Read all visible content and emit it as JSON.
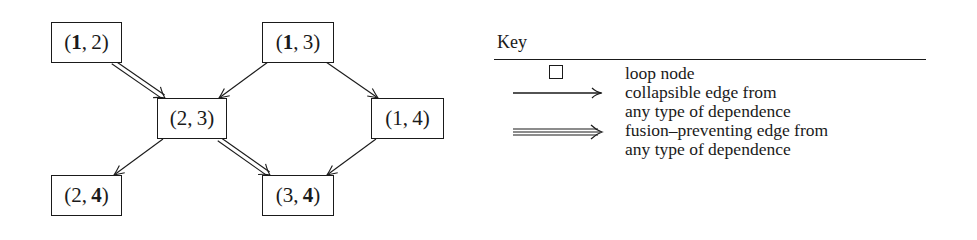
{
  "graph": {
    "nodes": [
      {
        "id": "n12",
        "label_open": "(",
        "first": "1",
        "sep": ", ",
        "second": "2",
        "label_close": ")",
        "bold_first": true,
        "bold_second": false,
        "x": 51,
        "y": 22,
        "w": 71,
        "h": 41
      },
      {
        "id": "n13",
        "label_open": "(",
        "first": "1",
        "sep": ", ",
        "second": "3",
        "label_close": ")",
        "bold_first": true,
        "bold_second": false,
        "x": 262,
        "y": 22,
        "w": 72,
        "h": 41
      },
      {
        "id": "n23",
        "label_open": "(",
        "first": "2",
        "sep": ", ",
        "second": "3",
        "label_close": ")",
        "bold_first": false,
        "bold_second": false,
        "x": 157,
        "y": 98,
        "w": 70,
        "h": 41
      },
      {
        "id": "n14",
        "label_open": "(",
        "first": "1",
        "sep": ", ",
        "second": "4",
        "label_close": ")",
        "bold_first": false,
        "bold_second": false,
        "x": 371,
        "y": 98,
        "w": 73,
        "h": 41
      },
      {
        "id": "n24",
        "label_open": "(",
        "first": "2",
        "sep": ", ",
        "second": "4",
        "label_close": ")",
        "bold_first": false,
        "bold_second": true,
        "x": 51,
        "y": 175,
        "w": 71,
        "h": 41
      },
      {
        "id": "n34",
        "label_open": "(",
        "first": "3",
        "sep": ", ",
        "second": "4",
        "label_close": ")",
        "bold_first": false,
        "bold_second": true,
        "x": 262,
        "y": 175,
        "w": 72,
        "h": 41
      }
    ],
    "edges": [
      {
        "from": "(1,2)",
        "to": "(2,3)",
        "type": "fusion-preventing",
        "x1": 113,
        "y1": 62,
        "x2": 165,
        "y2": 98
      },
      {
        "from": "(1,3)",
        "to": "(2,3)",
        "type": "collapsible",
        "x1": 268,
        "y1": 62,
        "x2": 219,
        "y2": 98
      },
      {
        "from": "(1,3)",
        "to": "(1,4)",
        "type": "collapsible",
        "x1": 326,
        "y1": 62,
        "x2": 378,
        "y2": 98
      },
      {
        "from": "(2,3)",
        "to": "(2,4)",
        "type": "collapsible",
        "x1": 163,
        "y1": 139,
        "x2": 114,
        "y2": 175
      },
      {
        "from": "(2,3)",
        "to": "(3,4)",
        "type": "fusion-preventing",
        "x1": 219,
        "y1": 139,
        "x2": 270,
        "y2": 175
      },
      {
        "from": "(1,4)",
        "to": "(3,4)",
        "type": "collapsible",
        "x1": 376,
        "y1": 139,
        "x2": 327,
        "y2": 175
      }
    ]
  },
  "key": {
    "title": "Key",
    "items": [
      {
        "symbol": "square",
        "lines": [
          "loop node"
        ]
      },
      {
        "symbol": "single-arrow",
        "lines": [
          "collapsible edge from",
          "any type of dependence"
        ]
      },
      {
        "symbol": "double-arrow",
        "lines": [
          "fusion–preventing edge from",
          "any type of dependence"
        ]
      }
    ]
  },
  "colors": {
    "ink": "#1a1a1a",
    "background": "#ffffff"
  }
}
